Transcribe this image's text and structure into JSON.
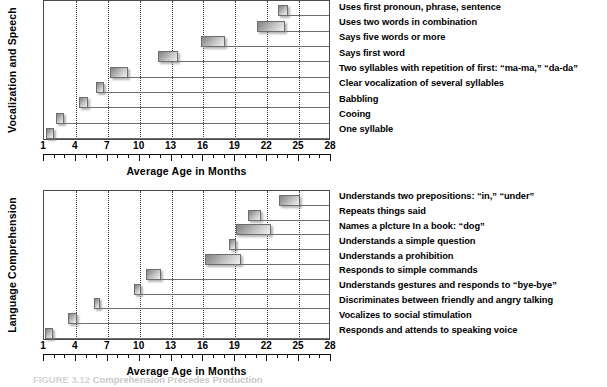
{
  "figure": {
    "caption_label": "FIGURE 3.12",
    "caption_text": "Comprehension Precedes Production"
  },
  "chart_data": [
    {
      "type": "bar",
      "orientation": "horizontal-range",
      "title": "",
      "ylabel": "Vocalization and Speech",
      "xlabel": "Average Age in Months",
      "xlim": [
        1,
        28
      ],
      "xticks": [
        1,
        4,
        7,
        10,
        13,
        16,
        19,
        22,
        25,
        28
      ],
      "grid": "vertical-dotted",
      "categories": [
        "Uses first pronoun, phrase, sentence",
        "Uses two words in combination",
        "Says five words or more",
        "Says first word",
        "Two syllables with repetition of first: “ma-ma,” “da-da”",
        "Clear vocalization of several syllables",
        "Babbling",
        "Cooing",
        "One syllable"
      ],
      "ranges": [
        [
          23.0,
          24.0
        ],
        [
          21.0,
          23.7
        ],
        [
          15.8,
          18.0
        ],
        [
          11.7,
          13.6
        ],
        [
          7.2,
          8.9
        ],
        [
          5.9,
          6.6
        ],
        [
          4.3,
          5.1
        ],
        [
          2.1,
          2.9
        ],
        [
          1.2,
          1.9
        ]
      ]
    },
    {
      "type": "bar",
      "orientation": "horizontal-range",
      "title": "",
      "ylabel": "Language Comprehension",
      "xlabel": "Average Age in Months",
      "xlim": [
        1,
        28
      ],
      "xticks": [
        1,
        4,
        7,
        10,
        13,
        16,
        19,
        22,
        25,
        28
      ],
      "grid": "vertical-dotted",
      "categories": [
        "Understands two prepositions: “in,” “under”",
        "Repeats things said",
        "Names a plcture In a book: “dog”",
        "Understands a simple question",
        "Understands a prohibition",
        "Responds to simple commands",
        "Understands gestures and responds to “bye-bye”",
        "Discriminates between friendly and angry talking",
        "Vocalizes to social stimulation",
        "Responds and attends to speaking voice"
      ],
      "ranges": [
        [
          23.1,
          25.1
        ],
        [
          20.2,
          21.4
        ],
        [
          19.1,
          22.4
        ],
        [
          18.4,
          19.1
        ],
        [
          16.1,
          19.5
        ],
        [
          10.6,
          12.0
        ],
        [
          9.5,
          10.1
        ],
        [
          5.7,
          6.3
        ],
        [
          3.3,
          4.1
        ],
        [
          1.1,
          1.8
        ]
      ]
    }
  ]
}
